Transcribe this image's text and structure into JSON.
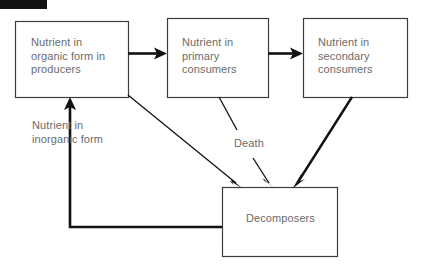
{
  "diagram": {
    "type": "flow-diagram",
    "background_color": "#ffffff",
    "line_color": "#1a1a1a",
    "text_color": "#6b6b6b",
    "redaction": {
      "name": "redaction-bar",
      "color": "#121212",
      "x": 0,
      "y": 0,
      "width": 47,
      "height": 9
    },
    "boxes": [
      {
        "id": "producers",
        "label": "Nutrient in\norganic form in\nproducers",
        "x": 15,
        "y": 21,
        "width": 113,
        "height": 76
      },
      {
        "id": "primary",
        "label": "Nutrient in\nprimary\nconsumers",
        "x": 167,
        "y": 18,
        "width": 101,
        "height": 79
      },
      {
        "id": "secondary",
        "label": "Nutrient in\nsecondary\nconsumers",
        "x": 303,
        "y": 18,
        "width": 104,
        "height": 79
      },
      {
        "id": "decomposers",
        "label": "Decomposers",
        "x": 222,
        "y": 187,
        "width": 115,
        "height": 69
      }
    ],
    "free_labels": [
      {
        "id": "inorganic",
        "text": "Nutrient in\ninorganic form"
      },
      {
        "id": "death",
        "text": "Death"
      }
    ],
    "arrows": [
      {
        "id": "producers-to-primary",
        "from": "producers",
        "to": "primary",
        "style": "thick-horizontal"
      },
      {
        "id": "primary-to-secondary",
        "from": "primary",
        "to": "secondary",
        "style": "thick-horizontal"
      },
      {
        "id": "producers-to-decomposers",
        "from": "producers",
        "to": "decomposers",
        "style": "thin-diagonal"
      },
      {
        "id": "primary-to-decomposers",
        "from": "primary",
        "to": "decomposers",
        "style": "thin-diagonal",
        "label": "Death"
      },
      {
        "id": "secondary-to-decomposers",
        "from": "secondary",
        "to": "decomposers",
        "style": "thick-diagonal"
      },
      {
        "id": "decomposers-to-producers",
        "from": "decomposers",
        "to": "producers",
        "style": "thick-elbow"
      }
    ]
  }
}
